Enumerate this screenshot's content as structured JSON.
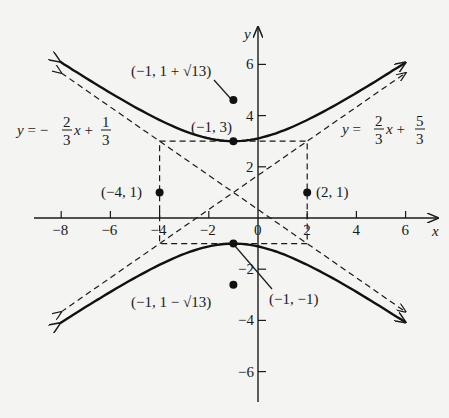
{
  "chart_data": {
    "type": "line",
    "title": "",
    "xlabel": "x",
    "ylabel": "y",
    "xlim": [
      -8.5,
      7.2
    ],
    "ylim": [
      -7.2,
      7.5
    ],
    "grid": false,
    "x_ticks": [
      -8,
      -6,
      -4,
      -2,
      0,
      2,
      4,
      6
    ],
    "x_tick_labels": [
      "−8",
      "−6",
      "−4",
      "−2",
      "0",
      "2",
      "4",
      "6"
    ],
    "y_ticks": [
      6,
      4,
      2,
      -2,
      -4,
      -6
    ],
    "y_tick_labels": [
      "6",
      "4",
      "2",
      "−2",
      "−4",
      "−6"
    ],
    "hyperbola": {
      "equation": "(y-1)^2/4 - (x+1)^2/9 = 1",
      "center": [
        -1,
        1
      ],
      "a": 2,
      "b": 3,
      "x_range": [
        -8.05,
        6.0
      ]
    },
    "asymptotes": [
      {
        "name": "asymptote-positive",
        "slope": 0.6667,
        "intercept": 1.6667,
        "label": {
          "lhs": "y =",
          "n1": "2",
          "d1": "3",
          "mid": "x +",
          "n2": "5",
          "d2": "3"
        },
        "x_range": [
          -8,
          6
        ]
      },
      {
        "name": "asymptote-negative",
        "slope": -0.6667,
        "intercept": 0.3333,
        "label": {
          "lhs": "y = −",
          "n1": "2",
          "d1": "3",
          "mid": "x +",
          "n2": "1",
          "d2": "3"
        },
        "x_range": [
          -8,
          6
        ]
      }
    ],
    "box": {
      "x_min": -4,
      "x_max": 2,
      "y_min": -1,
      "y_max": 3
    },
    "points": [
      {
        "x": -1,
        "y": 3,
        "label": "(−1, 3)",
        "kind": "vertex"
      },
      {
        "x": -1,
        "y": -1,
        "label": "(−1, −1)",
        "kind": "vertex"
      },
      {
        "x": -1,
        "y": 4.606,
        "label": "(−1, 1 + √13)",
        "kind": "focus"
      },
      {
        "x": -1,
        "y": -2.606,
        "label": "(−1, 1 − √13)",
        "kind": "focus"
      },
      {
        "x": -4,
        "y": 1,
        "label": "(−4, 1)",
        "kind": "co-vertex"
      },
      {
        "x": 2,
        "y": 1,
        "label": "(2, 1)",
        "kind": "co-vertex"
      }
    ]
  },
  "labels": {
    "x_axis": "x",
    "y_axis": "y",
    "p_vertex_top": "(−1, 3)",
    "p_vertex_bottom": "(−1, −1)",
    "p_focus_top": "(−1, 1 + √13)",
    "p_focus_bottom": "(−1, 1 − √13)",
    "p_covertex_left": "(−4, 1)",
    "p_covertex_right": "(2, 1)",
    "eq_left": {
      "lhs": "y = −",
      "n1": "2",
      "d1": "3",
      "mid": "x +",
      "n2": "1",
      "d2": "3"
    },
    "eq_right": {
      "lhs": "y =",
      "n1": "2",
      "d1": "3",
      "mid": "x +",
      "n2": "5",
      "d2": "3"
    },
    "ticks_x": [
      "−8",
      "−6",
      "−4",
      "−2",
      "0",
      "2",
      "4",
      "6"
    ],
    "ticks_y_pos": [
      "6",
      "4",
      "2"
    ],
    "ticks_y_neg": [
      "−2",
      "−4",
      "−6"
    ]
  }
}
